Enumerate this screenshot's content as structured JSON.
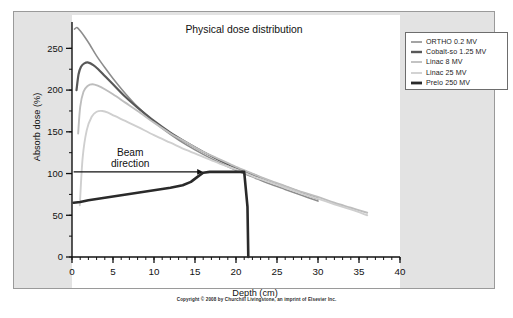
{
  "figure": {
    "title": "Physical dose distribution",
    "footer": "Copyright © 2008 by Churchill Livingstone, an imprint of Elsevier Inc."
  },
  "annotation": {
    "beam_line1": "Beam",
    "beam_line2": "direction"
  },
  "chart_data": {
    "type": "line",
    "title": "Physical dose distribution",
    "xlabel": "Depth (cm)",
    "ylabel": "Absorb dose (%)",
    "xlim": [
      0,
      40
    ],
    "ylim": [
      0,
      278
    ],
    "grid": false,
    "legend_position": "upper-right",
    "xticks": [
      0,
      5,
      10,
      15,
      20,
      25,
      30,
      35,
      40
    ],
    "xtick_labels": [
      "0",
      "5",
      "10",
      "15",
      "20",
      "25",
      "30",
      "35",
      "40"
    ],
    "xminor_step": 1,
    "yticks": [
      0,
      50,
      100,
      150,
      200,
      250
    ],
    "ytick_labels": [
      "0",
      "50",
      "100",
      "150",
      "200",
      "250"
    ],
    "yminor_step": 25,
    "annotations": [
      {
        "text": "Beam direction",
        "arrow_from": [
          0.2,
          102
        ],
        "arrow_to": [
          16.0,
          102
        ]
      }
    ],
    "series": [
      {
        "name": "ORTHO 0.2 MV",
        "color": "#8d8d8d",
        "width": 1.6,
        "x": [
          0.3,
          0.6,
          1.0,
          1.6,
          2.2,
          3.0,
          4.0,
          5.0,
          6.5,
          8.0,
          10.0,
          12.0,
          14.0,
          16.0,
          18.0,
          20.0,
          22.0,
          24.0,
          26.0,
          28.0,
          30.0
        ],
        "y": [
          273,
          275,
          271,
          263,
          254,
          241,
          227,
          214,
          196,
          180,
          162,
          147,
          134,
          123,
          113,
          104,
          96,
          88,
          81,
          74,
          67
        ]
      },
      {
        "name": "Cobalt-so 1.25 MV",
        "color": "#585858",
        "width": 2.2,
        "x": [
          0.55,
          0.8,
          1.1,
          1.5,
          2.0,
          2.6,
          3.2,
          4.0,
          5.0,
          6.5,
          8.0,
          10.0,
          12.0,
          14.0,
          16.0,
          18.0,
          20.0,
          22.0,
          24.0,
          26.0,
          28.0,
          30.0
        ],
        "y": [
          200,
          219,
          228,
          232,
          233,
          230,
          225,
          217,
          207,
          192,
          179,
          163,
          149,
          137,
          126,
          116,
          107,
          99,
          91,
          84,
          77,
          70
        ]
      },
      {
        "name": "Linac 8 MV",
        "color": "#bdbdbd",
        "width": 1.9,
        "x": [
          0.75,
          1.0,
          1.4,
          1.9,
          2.5,
          3.2,
          4.0,
          5.0,
          6.5,
          8.0,
          10.0,
          12.0,
          14.0,
          16.0,
          18.0,
          20.0,
          22.0,
          24.0,
          26.0,
          28.0,
          30.0,
          32.0,
          34.0,
          36.0
        ],
        "y": [
          148,
          180,
          198,
          205,
          207,
          205,
          201,
          195,
          185,
          175,
          161,
          148,
          137,
          126,
          117,
          108,
          100,
          92,
          85,
          78,
          72,
          65,
          59,
          53
        ]
      },
      {
        "name": "Linac 25 MV",
        "color": "#cfcfcf",
        "width": 1.9,
        "x": [
          0.95,
          1.3,
          1.8,
          2.4,
          3.0,
          3.7,
          4.4,
          5.2,
          6.5,
          8.0,
          10.0,
          12.0,
          14.0,
          16.0,
          18.0,
          20.0,
          22.0,
          24.0,
          26.0,
          28.0,
          30.0,
          32.0,
          34.0,
          36.0
        ],
        "y": [
          62,
          119,
          152,
          168,
          174,
          175,
          173,
          169,
          163,
          156,
          146,
          137,
          128,
          120,
          112,
          105,
          97,
          90,
          83,
          76,
          70,
          63,
          57,
          50
        ]
      },
      {
        "name": "Prelo 250 MV",
        "color": "#2a2a2a",
        "width": 2.6,
        "x": [
          0.2,
          1.0,
          2.0,
          4.0,
          6.0,
          8.0,
          10.0,
          12.0,
          13.5,
          14.5,
          15.3,
          16.0,
          16.8,
          19.0,
          20.8,
          21.0,
          21.4,
          21.5
        ],
        "y": [
          65,
          66,
          68,
          71,
          74,
          77,
          80,
          83,
          86,
          90,
          96,
          101,
          102,
          102,
          102,
          102,
          60,
          0
        ]
      }
    ]
  },
  "legend": {
    "items": [
      {
        "label": "ORTHO 0.2 MV",
        "color": "#8d8d8d",
        "thickness": "1.6"
      },
      {
        "label": "Cobalt-so 1.25 MV",
        "color": "#585858",
        "thickness": "2.4"
      },
      {
        "label": "Linac 8 MV",
        "color": "#bdbdbd",
        "thickness": "1.8"
      },
      {
        "label": "Linac 25 MV",
        "color": "#cfcfcf",
        "thickness": "1.8"
      },
      {
        "label": "Prelo 250 MV",
        "color": "#2a2a2a",
        "thickness": "2.8"
      }
    ]
  }
}
